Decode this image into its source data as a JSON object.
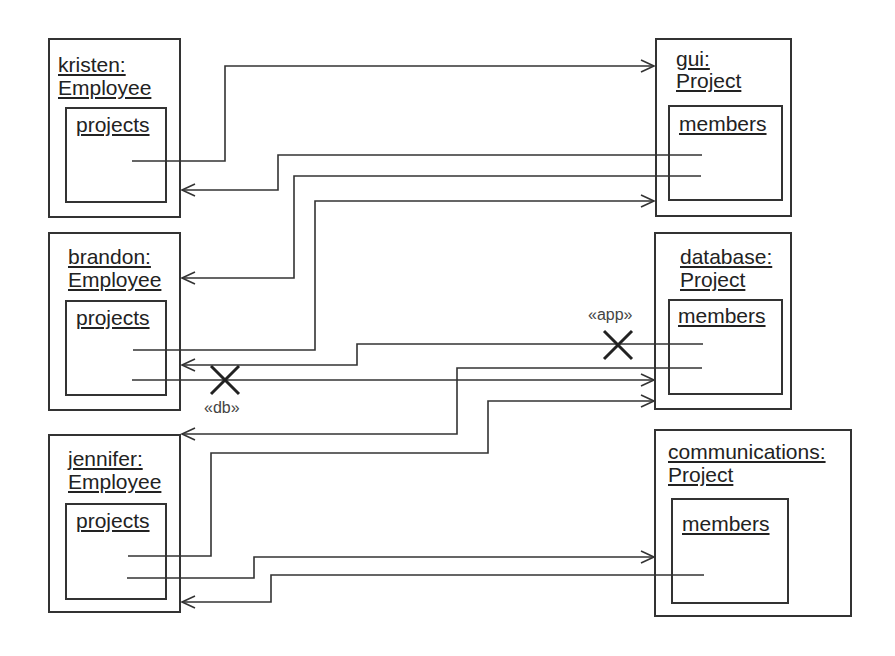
{
  "diagram": {
    "type": "uml-object-diagram",
    "employees": [
      {
        "id": "kristen",
        "title_line1": "kristen:",
        "title_line2": "Employee",
        "slot": "projects"
      },
      {
        "id": "brandon",
        "title_line1": "brandon:",
        "title_line2": "Employee",
        "slot": "projects"
      },
      {
        "id": "jennifer",
        "title_line1": "jennifer:",
        "title_line2": "Employee",
        "slot": "projects"
      }
    ],
    "projects": [
      {
        "id": "gui",
        "title_line1": "gui:",
        "title_line2": "Project",
        "slot": "members"
      },
      {
        "id": "database",
        "title_line1": "database:",
        "title_line2": "Project",
        "slot": "members"
      },
      {
        "id": "communications",
        "title_line1": "communications:",
        "title_line2": "Project",
        "slot": "members"
      }
    ],
    "links": [
      {
        "from": "kristen.projects",
        "to": "gui"
      },
      {
        "from": "gui.members",
        "to": "kristen"
      },
      {
        "from": "gui.members",
        "to": "brandon"
      },
      {
        "from": "brandon.projects",
        "to": "gui"
      },
      {
        "from": "database.members",
        "to": "brandon",
        "broken": true,
        "stereotype": "«app»"
      },
      {
        "from": "brandon.projects",
        "to": "database",
        "broken": true,
        "stereotype": "«db»"
      },
      {
        "from": "database.members",
        "to": "jennifer"
      },
      {
        "from": "jennifer.projects",
        "to": "database"
      },
      {
        "from": "jennifer.projects",
        "to": "communications"
      },
      {
        "from": "communications.members",
        "to": "jennifer"
      }
    ],
    "stereotypes": {
      "app": "«app»",
      "db": "«db»"
    }
  }
}
